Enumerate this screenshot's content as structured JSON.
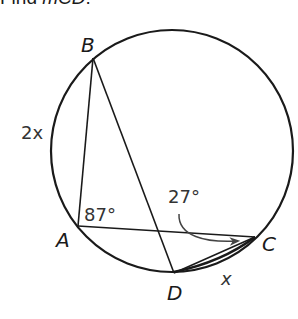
{
  "prompt": {
    "prefix": "Find ",
    "measure_symbol": "m",
    "arc": "CD",
    "suffix": "."
  },
  "diagram": {
    "type": "inscribed-angles-in-circle",
    "circle": {
      "cx": 172,
      "cy": 151,
      "r": 121
    },
    "points": {
      "A": {
        "label": "A",
        "x": 78,
        "y": 226
      },
      "B": {
        "label": "B",
        "x": 93,
        "y": 58
      },
      "C": {
        "label": "C",
        "x": 255,
        "y": 237
      },
      "D": {
        "label": "D",
        "x": 174,
        "y": 274
      }
    },
    "segments": [
      "AB",
      "BD",
      "AC",
      "DC"
    ],
    "labels": {
      "arc_AB": "2x",
      "arc_CD": "x",
      "angle_A": "87°",
      "angle_C": "27°"
    },
    "colors": {
      "stroke": "#1a1a1a",
      "text": "#1a1a1a"
    }
  }
}
